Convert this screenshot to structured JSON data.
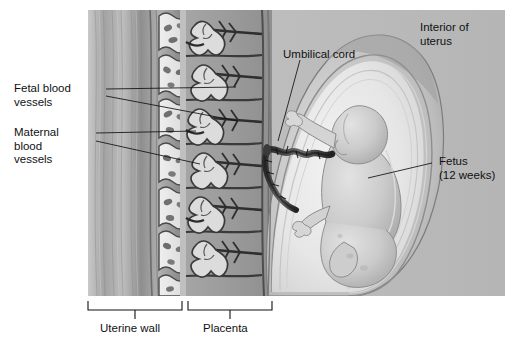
{
  "figure": {
    "type": "anatomical-illustration",
    "background_color": "#ffffff",
    "illustration_bg": "#b9b9b9"
  },
  "labels": {
    "fetal_blood_vessels": "Fetal blood\nvessels",
    "maternal_blood_vessels": "Maternal\nblood\nvessels",
    "umbilical_cord": "Umbilical cord",
    "interior_of_uterus": "Interior of\nuterus",
    "fetus": "Fetus\n(12 weeks)",
    "uterine_wall": "Uterine wall",
    "placenta": "Placenta"
  },
  "colors": {
    "text": "#111111",
    "leader_line": "#111111",
    "uterine_muscle": "#9a9a9a",
    "lacuna_fill": "#e8e8e8",
    "villi_light": "#d8d8d8",
    "vessel_dark": "#2e2e2e",
    "amniotic_fluid": "#e6e6e6",
    "fetus_body": "#cfcfcf",
    "uterus_wall_outer": "#a8a8a8"
  },
  "structures": {
    "uterine_wall_label": "Uterine wall",
    "placenta_label": "Placenta",
    "villi_count": 6,
    "lacunae_rows": 6
  }
}
